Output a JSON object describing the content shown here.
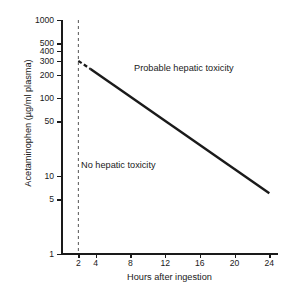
{
  "chart_data": {
    "type": "line",
    "title": "",
    "xlabel": "Hours after ingestion",
    "ylabel": "Acetaminophen (µg/ml plasma)",
    "xlim": [
      0,
      25
    ],
    "ylim": [
      1,
      1000
    ],
    "yscale": "log",
    "xscale": "linear",
    "grid": false,
    "legend": null,
    "xticks": [
      {
        "value": 2,
        "label": "2"
      },
      {
        "value": 4,
        "label": "4"
      },
      {
        "value": 8,
        "label": "8"
      },
      {
        "value": 12,
        "label": "12"
      },
      {
        "value": 16,
        "label": "16"
      },
      {
        "value": 20,
        "label": "20"
      },
      {
        "value": 24,
        "label": "24"
      }
    ],
    "yticks": [
      {
        "value": 1000,
        "label": "1000"
      },
      {
        "value": 500,
        "label": "500"
      },
      {
        "value": 400,
        "label": "400"
      },
      {
        "value": 300,
        "label": "300"
      },
      {
        "value": 200,
        "label": "200"
      },
      {
        "value": 100,
        "label": "100"
      },
      {
        "value": 50,
        "label": "50"
      },
      {
        "value": 10,
        "label": "10"
      },
      {
        "value": 5,
        "label": "5"
      },
      {
        "value": 1,
        "label": "1"
      }
    ],
    "series": [
      {
        "name": "treatment-line-dashed-segment",
        "style": "dashed",
        "color": "#1a1a1a",
        "x": [
          2,
          3.4
        ],
        "y": [
          300,
          235
        ]
      },
      {
        "name": "treatment-line-solid",
        "style": "solid",
        "color": "#1a1a1a",
        "x": [
          3.4,
          24
        ],
        "y": [
          235,
          6
        ]
      }
    ],
    "reference_lines": [
      {
        "name": "four-hour-marker",
        "orientation": "vertical",
        "x": 2,
        "style": "dashed",
        "color": "#555555"
      }
    ],
    "annotations": [
      {
        "name": "probable-toxicity-label",
        "text": "Probable hepatic toxicity",
        "x": 9.5,
        "y": 230
      },
      {
        "name": "no-toxicity-label",
        "text": "No hepatic toxicity",
        "x": 3.8,
        "y": 17
      }
    ]
  },
  "axes": {
    "x_title": "Hours after ingestion",
    "y_title": "Acetaminophen (µg/ml plasma)"
  },
  "labels": {
    "probable": "Probable hepatic toxicity",
    "none": "No hepatic toxicity"
  },
  "colors": {
    "line": "#1a1a1a",
    "axis": "#1a1a1a",
    "dashed_marker": "#555555",
    "background": "#ffffff"
  }
}
